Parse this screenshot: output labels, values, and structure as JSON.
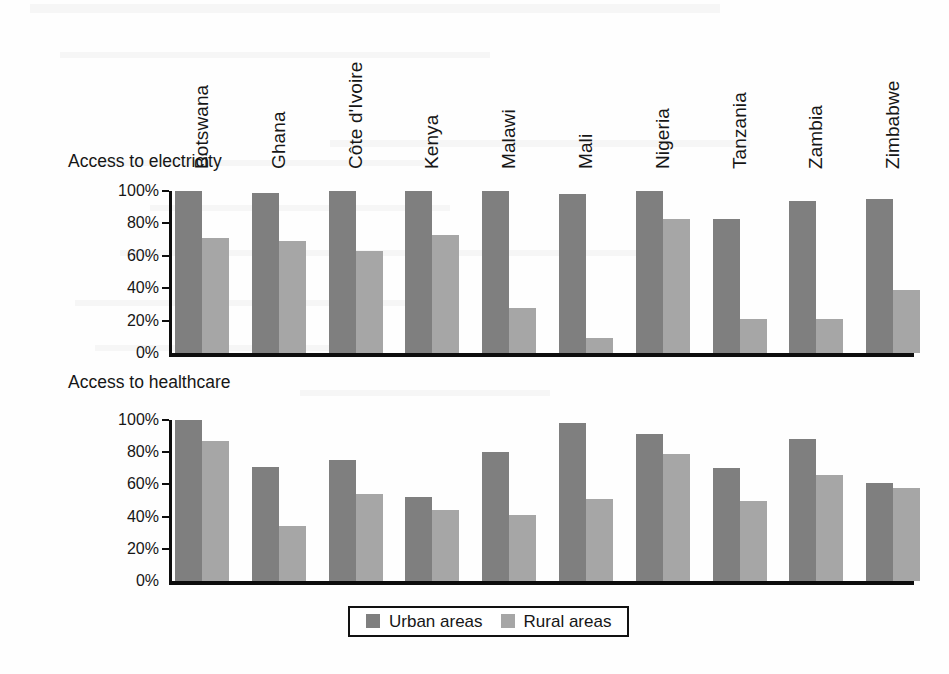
{
  "chart_data": [
    {
      "type": "bar",
      "title": "Access to electricity",
      "xlabel": "",
      "ylabel": "",
      "ylim": [
        0,
        100
      ],
      "ytick_labels": [
        "0%",
        "20%",
        "40%",
        "60%",
        "80%",
        "100%"
      ],
      "yticks": [
        0,
        20,
        40,
        60,
        80,
        100
      ],
      "grid": false,
      "legend_position": "bottom",
      "categories": [
        "Botswana",
        "Ghana",
        "Côte d'Ivoire",
        "Kenya",
        "Malawi",
        "Mali",
        "Nigeria",
        "Tanzania",
        "Zambia",
        "Zimbabwe"
      ],
      "series": [
        {
          "name": "Urban areas",
          "color": "#7f7f7f",
          "values": [
            100,
            99,
            100,
            100,
            100,
            98,
            100,
            83,
            94,
            95
          ]
        },
        {
          "name": "Rural areas",
          "color": "#a6a6a6",
          "values": [
            71,
            69,
            63,
            73,
            28,
            9,
            83,
            21,
            21,
            39
          ]
        }
      ]
    },
    {
      "type": "bar",
      "title": "Access to healthcare",
      "xlabel": "",
      "ylabel": "",
      "ylim": [
        0,
        100
      ],
      "ytick_labels": [
        "0%",
        "20%",
        "40%",
        "60%",
        "80%",
        "100%"
      ],
      "yticks": [
        0,
        20,
        40,
        60,
        80,
        100
      ],
      "grid": false,
      "legend_position": "bottom",
      "categories": [
        "Botswana",
        "Ghana",
        "Côte d'Ivoire",
        "Kenya",
        "Malawi",
        "Mali",
        "Nigeria",
        "Tanzania",
        "Zambia",
        "Zimbabwe"
      ],
      "series": [
        {
          "name": "Urban areas",
          "color": "#7f7f7f",
          "values": [
            100,
            71,
            75,
            52,
            80,
            98,
            91,
            70,
            88,
            61
          ]
        },
        {
          "name": "Rural areas",
          "color": "#a6a6a6",
          "values": [
            87,
            34,
            54,
            44,
            41,
            51,
            79,
            50,
            66,
            58
          ]
        }
      ]
    }
  ],
  "legend": {
    "entries": [
      {
        "label": "Urban areas",
        "color": "#7f7f7f"
      },
      {
        "label": "Rural areas",
        "color": "#a6a6a6"
      }
    ]
  }
}
